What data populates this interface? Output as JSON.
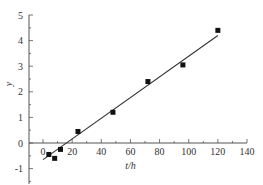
{
  "chart_data": {
    "type": "scatter",
    "title": "",
    "xlabel": "t/h",
    "ylabel": "y",
    "xlim": [
      -10,
      140
    ],
    "ylim": [
      -1.6,
      5
    ],
    "xticks": [
      0,
      20,
      40,
      60,
      80,
      100,
      120,
      140
    ],
    "xtick_labels": [
      "0",
      "20",
      "40",
      "60",
      "80",
      "100",
      "120",
      "140"
    ],
    "yticks": [
      -1,
      0,
      1,
      2,
      3,
      4,
      5
    ],
    "ytick_labels": [
      "-1",
      "0",
      "1",
      "2",
      "3",
      "4",
      "5"
    ],
    "grid": false,
    "legend": null,
    "series": [
      {
        "name": "data",
        "marker": "square",
        "x": [
          4,
          8,
          12,
          24,
          48,
          72,
          96,
          120
        ],
        "y": [
          -0.45,
          -0.6,
          -0.25,
          0.45,
          1.2,
          2.4,
          3.05,
          4.4
        ]
      },
      {
        "name": "fit",
        "type": "line",
        "x": [
          0,
          120
        ],
        "y": [
          -0.65,
          4.2
        ]
      }
    ]
  },
  "colors": {
    "axis": "#555555",
    "marker": "#111111",
    "line": "#333333"
  }
}
